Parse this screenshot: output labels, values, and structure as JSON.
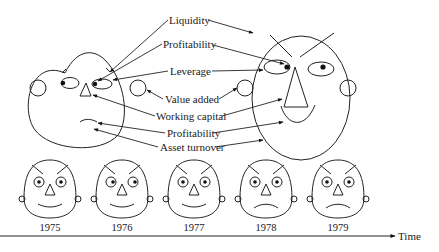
{
  "diagram": {
    "labels": {
      "liquidity": "Liquidity",
      "profitability_top": "Profitability",
      "leverage": "Leverage",
      "value_added": "Value added",
      "working_capital": "Working capital",
      "profitability_bottom": "Profitability",
      "asset_turnover": "Asset turnover"
    },
    "feature_mapping": [
      {
        "label": "Liquidity",
        "feature": "eyebrow slant"
      },
      {
        "label": "Profitability",
        "feature": "pupil position"
      },
      {
        "label": "Leverage",
        "feature": "eye size"
      },
      {
        "label": "Value added",
        "feature": "ear size"
      },
      {
        "label": "Working capital",
        "feature": "nose size"
      },
      {
        "label": "Profitability",
        "feature": "mouth curvature"
      },
      {
        "label": "Asset turnover",
        "feature": "face shape"
      }
    ],
    "timeline": {
      "axis_label": "Time",
      "years": [
        "1975",
        "1976",
        "1977",
        "1978",
        "1979"
      ],
      "mood": [
        "smile",
        "smile",
        "smile",
        "frown",
        "frown"
      ]
    },
    "icons": {
      "axis_arrow": "arrow-right-icon",
      "face": "face-icon"
    }
  }
}
